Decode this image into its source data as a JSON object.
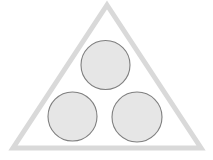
{
  "canvas": {
    "width": 213,
    "height": 160,
    "background_color": "#ffffff",
    "title": "Triangle enclosing three circles"
  },
  "palette": {
    "triangle_stroke": "#d9d9d9",
    "triangle_fill": "none",
    "circle_fill": "#e6e6e6",
    "circle_stroke": "#7f7f7f",
    "background": "#ffffff"
  },
  "shapes": {
    "triangle": {
      "name": "outer-triangle",
      "kind": "triangle",
      "points": "107,5 201,148 13,148",
      "stroke_color": "#d9d9d9",
      "stroke_width": 5,
      "fill": "none",
      "apex_x": 107,
      "apex_y": 5,
      "bottom_left_x": 13,
      "bottom_left_y": 148,
      "bottom_right_x": 201,
      "bottom_right_y": 148
    },
    "circles": [
      {
        "name": "top-circle",
        "kind": "circle",
        "cx": 105.5,
        "cy": 65,
        "r": 24.5,
        "fill": "#e6e6e6",
        "stroke_color": "#7f7f7f",
        "stroke_width": 1.1
      },
      {
        "name": "bottom-left-circle",
        "kind": "circle",
        "cx": 72.5,
        "cy": 116.5,
        "r": 24.5,
        "fill": "#e6e6e6",
        "stroke_color": "#7f7f7f",
        "stroke_width": 1.1
      },
      {
        "name": "bottom-right-circle",
        "kind": "circle",
        "cx": 137,
        "cy": 117,
        "r": 25,
        "fill": "#e6e6e6",
        "stroke_color": "#7f7f7f",
        "stroke_width": 1.1
      }
    ]
  }
}
